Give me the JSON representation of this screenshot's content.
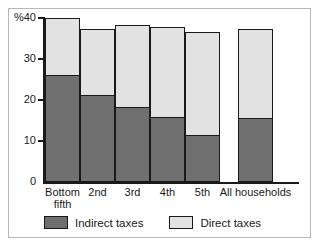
{
  "chart_data": {
    "type": "bar",
    "stacked": true,
    "title": "",
    "subtitle": "",
    "xlabel": "",
    "ylabel": "%",
    "unit_label": "%",
    "ylim": [
      0,
      40
    ],
    "yticks": [
      0,
      10,
      20,
      30,
      40
    ],
    "ytick_labels": [
      "0",
      "10",
      "20",
      "30",
      "40"
    ],
    "grid": false,
    "legend_position": "bottom",
    "categories": [
      "Bottom\nfifth",
      "2nd",
      "3rd",
      "4th",
      "5th",
      "All households"
    ],
    "series": [
      {
        "name": "Indirect taxes",
        "color": "#6f6f6f",
        "values": [
          25.8,
          21.0,
          18.0,
          15.5,
          11.2,
          15.3
        ]
      },
      {
        "name": "Direct taxes",
        "color": "#e2e2e2",
        "values": [
          14.2,
          16.2,
          20.3,
          22.3,
          25.3,
          21.9
        ]
      }
    ],
    "totals": [
      40.0,
      37.2,
      38.3,
      37.8,
      36.5,
      37.2
    ],
    "legend": [
      {
        "label": "Indirect taxes",
        "color": "#6f6f6f"
      },
      {
        "label": "Direct taxes",
        "color": "#e2e2e2"
      }
    ]
  },
  "colors": {
    "indirect": "#6f6f6f",
    "direct": "#e2e2e2",
    "outline": "#1a1a1a",
    "frame": "#b8b8b8",
    "background": "#ffffff"
  }
}
